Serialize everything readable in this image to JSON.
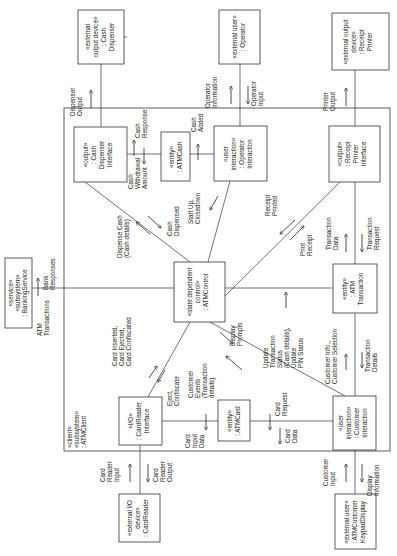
{
  "diagram": {
    "orientation": "rotated-90-ccw",
    "subsystem": {
      "lines": [
        "«client»",
        "«subsystem»",
        ": ATMClient"
      ]
    },
    "objects": {
      "cash_dispenser": {
        "lines": [
          "«external",
          "output device»",
          ": Cash",
          "Dispenser"
        ]
      },
      "operator": {
        "lines": [
          "«external user»",
          ": Operator"
        ]
      },
      "receipt_printer": {
        "lines": [
          "«external output",
          "device»",
          ": Receipt",
          "Printer"
        ]
      },
      "banking_service": {
        "lines": [
          "«service»",
          "«subsystem»",
          ": BankingService"
        ]
      },
      "cash_dispenser_interface": {
        "lines": [
          "«output»",
          ": Cash",
          "Dispenser",
          "Interface"
        ]
      },
      "atm_cash": {
        "lines": [
          "«entity»",
          ": ATMCash"
        ]
      },
      "operator_interaction": {
        "lines": [
          "«user",
          "interaction»",
          ": Operator",
          "Interaction"
        ]
      },
      "receipt_printer_interface": {
        "lines": [
          "«output»",
          ": Receipt",
          "Printer",
          "Interface"
        ]
      },
      "atm_control": {
        "lines": [
          "«state dependent",
          "control»",
          ": ATMControl"
        ]
      },
      "atm_transaction": {
        "lines": [
          "«entity»",
          ": ATM",
          "Transaction"
        ]
      },
      "card_reader_interface": {
        "lines": [
          "«I/O»",
          ": CardReader",
          "Interface"
        ]
      },
      "atm_card": {
        "lines": [
          "«entity»",
          ": ATMCard"
        ]
      },
      "customer_interaction": {
        "lines": [
          "«user",
          "interaction»",
          ": Customer",
          "Interaction"
        ]
      },
      "card_reader": {
        "lines": [
          "«external I/O",
          "device»",
          ": CardReader"
        ]
      },
      "keypad_display": {
        "lines": [
          "«external user»",
          ": ATMCustomer",
          "KeypadDisplay"
        ]
      }
    },
    "messages": {
      "dispenser_output": [
        "Dispenser",
        "Output"
      ],
      "operator_information": [
        "Operator",
        "Information"
      ],
      "operator_input": [
        "Operator",
        "Input"
      ],
      "printer_output": [
        "Printer",
        "Output"
      ],
      "cash_response": [
        "Cash",
        "Response"
      ],
      "cash_withdrawal_amount": [
        "Cash",
        "Withdrawal",
        "Amount"
      ],
      "cash_added": [
        "Cash",
        "Added"
      ],
      "dispense_cash": [
        "Dispense Cash",
        "(Cash details)"
      ],
      "cash_dispensed": [
        "Cash",
        "Dispensed"
      ],
      "startup_closedown": [
        "Start Up,",
        "Closedown"
      ],
      "receipt_printed": [
        "Receipt",
        "Printed"
      ],
      "print_receipt": [
        "Print",
        "Receipt"
      ],
      "transaction_data": [
        "Transaction",
        "Data"
      ],
      "transaction_request": [
        "Transaction",
        "Request"
      ],
      "bank_responses": [
        "Bank",
        "Responses"
      ],
      "atm_transactions": [
        "ATM",
        "Transactions"
      ],
      "card_inserted": [
        "Card Inserted,",
        "Card Ejected,",
        "Card Confiscated"
      ],
      "eject_confiscate": [
        "Eject,",
        "Confiscate"
      ],
      "customer_events": [
        "Customer",
        "Events",
        "(Transaction",
        "details)"
      ],
      "display_prompts": [
        "Display",
        "Prompts"
      ],
      "update_transaction_status": [
        "Update",
        "Transaction",
        "Status",
        "(Cash details),",
        "Update",
        "PIN Status"
      ],
      "customer_info": [
        "Customer Info.,",
        "Customer Selection"
      ],
      "transaction_details": [
        "Transaction",
        "Details"
      ],
      "card_request": [
        "Card",
        "Request"
      ],
      "card_input_data": [
        "Card",
        "Input",
        "Data"
      ],
      "card_data": [
        "Card",
        "Data"
      ],
      "card_reader_input": [
        "Card",
        "Reader",
        "Input"
      ],
      "card_reader_output": [
        "Card",
        "Reader",
        "Output"
      ],
      "customer_input": [
        "Customer",
        "Input"
      ],
      "display_information": [
        "Display",
        "Information"
      ]
    }
  }
}
